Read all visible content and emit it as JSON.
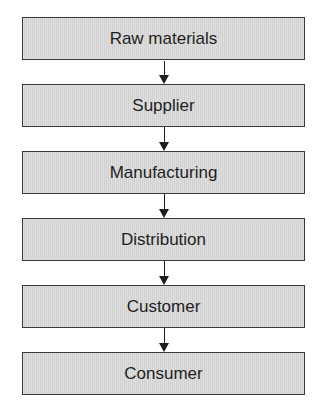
{
  "diagram": {
    "type": "flowchart",
    "direction": "top-to-bottom",
    "nodes": [
      {
        "id": "raw_materials",
        "label": "Raw materials"
      },
      {
        "id": "supplier",
        "label": "Supplier"
      },
      {
        "id": "manufacturing",
        "label": "Manufacturing"
      },
      {
        "id": "distribution",
        "label": "Distribution"
      },
      {
        "id": "customer",
        "label": "Customer"
      },
      {
        "id": "consumer",
        "label": "Consumer"
      }
    ],
    "edges": [
      {
        "from": "raw_materials",
        "to": "supplier"
      },
      {
        "from": "supplier",
        "to": "manufacturing"
      },
      {
        "from": "manufacturing",
        "to": "distribution"
      },
      {
        "from": "distribution",
        "to": "customer"
      },
      {
        "from": "customer",
        "to": "consumer"
      }
    ],
    "colors": {
      "box_fill": "#d9d9d9",
      "box_border": "#3a3a3a",
      "arrow": "#1e1e1e",
      "text": "#1e1e1e"
    }
  }
}
